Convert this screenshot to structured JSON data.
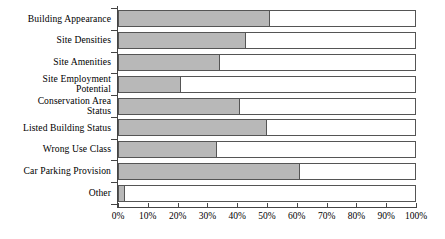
{
  "chart_data": {
    "type": "bar",
    "orientation": "horizontal",
    "title": "",
    "subtitle": "",
    "xlabel": "",
    "ylabel": "",
    "xlim": [
      0,
      100
    ],
    "grid": false,
    "legend": null,
    "bar_fill_color": "#b8b8b8",
    "bar_outline_color": "#555555",
    "background_color": "#ffffff",
    "axis_color": "#444444",
    "xticks": [
      0,
      10,
      20,
      30,
      40,
      50,
      60,
      70,
      80,
      90,
      100
    ],
    "xtick_labels": [
      "0%",
      "10%",
      "20%",
      "30%",
      "40%",
      "50%",
      "60%",
      "70%",
      "80%",
      "90%",
      "100%"
    ],
    "categories": [
      "Building Appearance",
      "Site Densities",
      "Site Amenities",
      "Site Employment\nPotential",
      "Conservation Area\nStatus",
      "Listed Building Status",
      "Wrong Use Class",
      "Car Parking Provision",
      "Other"
    ],
    "values": [
      51,
      43,
      34,
      21,
      41,
      50,
      33,
      61,
      2
    ],
    "value_unit": "%"
  }
}
